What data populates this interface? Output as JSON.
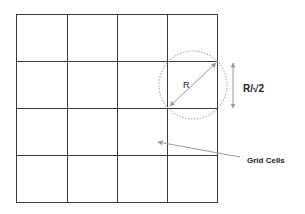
{
  "diagram": {
    "type": "grid-cells-neighborhood",
    "grid": {
      "rows": 4,
      "cols": 4,
      "line_color": "#3a3a3a"
    },
    "labels": {
      "radius": "R",
      "cell_size": "R/√2",
      "grid_cells": "Grid Cells"
    },
    "colors": {
      "circle": "#b0b0b0",
      "arrow": "#9a9a9a",
      "text": "#222222"
    }
  }
}
